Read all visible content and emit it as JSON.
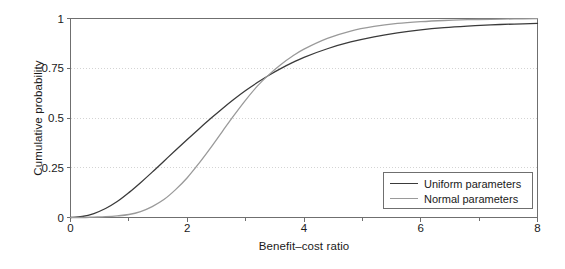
{
  "chart_data": {
    "type": "line",
    "title": "",
    "xlabel": "Benefit–cost ratio",
    "ylabel": "Cumulative probability",
    "xlim": [
      0,
      8
    ],
    "ylim": [
      0,
      1
    ],
    "xticks": [
      0,
      2,
      4,
      6,
      8
    ],
    "xticklabels": [
      "0",
      "2",
      "4",
      "6",
      "8"
    ],
    "xminorticks": [
      1,
      3,
      5,
      7
    ],
    "yticks": [
      0,
      0.25,
      0.5,
      0.75,
      1
    ],
    "yticklabels": [
      "0",
      "0.25",
      "0.5",
      "0.75",
      "1"
    ],
    "grid": "horizontal-dotted",
    "legend_position": "lower-right",
    "series": [
      {
        "name": "Uniform parameters",
        "color": "#3a3a3a",
        "x": [
          0,
          0.2,
          0.4,
          0.6,
          0.8,
          1.0,
          1.2,
          1.4,
          1.6,
          1.8,
          2.0,
          2.2,
          2.4,
          2.6,
          2.8,
          3.0,
          3.2,
          3.4,
          3.6,
          3.8,
          4.0,
          4.4,
          4.8,
          5.2,
          5.6,
          6.0,
          6.4,
          6.8,
          7.2,
          7.6,
          8.0
        ],
        "y": [
          0.0,
          0.005,
          0.02,
          0.045,
          0.08,
          0.125,
          0.175,
          0.228,
          0.283,
          0.338,
          0.392,
          0.445,
          0.497,
          0.547,
          0.594,
          0.638,
          0.678,
          0.715,
          0.748,
          0.778,
          0.805,
          0.848,
          0.882,
          0.908,
          0.928,
          0.943,
          0.954,
          0.962,
          0.968,
          0.972,
          0.975
        ]
      },
      {
        "name": "Normal parameters",
        "color": "#9a9a9a",
        "x": [
          0,
          0.2,
          0.4,
          0.6,
          0.8,
          1.0,
          1.2,
          1.4,
          1.6,
          1.8,
          2.0,
          2.2,
          2.4,
          2.6,
          2.8,
          3.0,
          3.2,
          3.4,
          3.6,
          3.8,
          4.0,
          4.4,
          4.8,
          5.2,
          5.6,
          6.0,
          6.4,
          6.8,
          7.2,
          7.6,
          8.0
        ],
        "y": [
          0.0,
          0.0,
          0.002,
          0.004,
          0.008,
          0.015,
          0.03,
          0.055,
          0.09,
          0.14,
          0.2,
          0.272,
          0.35,
          0.432,
          0.513,
          0.59,
          0.66,
          0.718,
          0.768,
          0.81,
          0.846,
          0.9,
          0.937,
          0.96,
          0.975,
          0.984,
          0.99,
          0.994,
          0.996,
          0.998,
          0.999
        ]
      }
    ],
    "annotations": {
      "crossing_point": "~3.6, 0.75"
    }
  },
  "legend": {
    "entries": [
      {
        "label": "Uniform parameters",
        "color": "#3a3a3a"
      },
      {
        "label": "Normal parameters",
        "color": "#9a9a9a"
      }
    ]
  },
  "axes": {
    "y_title": "Cumulative probability",
    "x_title": "Benefit–cost ratio",
    "y_tick_labels": [
      "1",
      "0.75",
      "0.5",
      "0.25",
      "0"
    ],
    "x_tick_labels": [
      "0",
      "2",
      "4",
      "6",
      "8"
    ]
  },
  "colors": {
    "axis": "#6f6f6f",
    "grid": "#cfcfcf",
    "uniform_series": "#3a3a3a",
    "normal_series": "#9a9a9a",
    "text": "#1a1a1a",
    "background": "#ffffff"
  }
}
